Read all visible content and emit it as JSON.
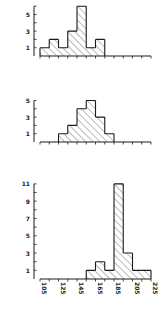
{
  "chart_data": [
    {
      "type": "bar",
      "subtype": "histogram",
      "title": "",
      "xlabel": "",
      "ylabel": "",
      "bin_width": 10,
      "bins": [
        "105-115",
        "115-125",
        "125-135",
        "135-145",
        "145-155",
        "155-165",
        "165-175",
        "175-185",
        "185-195",
        "195-205",
        "205-215",
        "215-225"
      ],
      "values": [
        1,
        2,
        1,
        3,
        6,
        1,
        2,
        0,
        0,
        0,
        0,
        0
      ],
      "ylim": [
        0,
        6
      ],
      "ytick_labels": [
        "1",
        "3",
        "5"
      ],
      "xlim": [
        105,
        225
      ],
      "hatched": true
    },
    {
      "type": "bar",
      "subtype": "histogram",
      "title": "",
      "xlabel": "",
      "ylabel": "",
      "bin_width": 10,
      "bins": [
        "105-115",
        "115-125",
        "125-135",
        "135-145",
        "145-155",
        "155-165",
        "165-175",
        "175-185",
        "185-195",
        "195-205",
        "205-215",
        "215-225"
      ],
      "values": [
        0,
        0,
        1,
        2,
        4,
        5,
        3,
        1,
        0,
        0,
        0,
        0
      ],
      "ylim": [
        0,
        5
      ],
      "ytick_labels": [
        "1",
        "3",
        "5"
      ],
      "xlim": [
        105,
        225
      ],
      "hatched": true
    },
    {
      "type": "bar",
      "subtype": "histogram",
      "title": "",
      "xlabel": "",
      "ylabel": "",
      "bin_width": 10,
      "bins": [
        "105-115",
        "115-125",
        "125-135",
        "135-145",
        "145-155",
        "155-165",
        "165-175",
        "175-185",
        "185-195",
        "195-205",
        "205-215",
        "215-225"
      ],
      "values": [
        0,
        0,
        0,
        0,
        0,
        1,
        2,
        1,
        11,
        3,
        1,
        1
      ],
      "ylim": [
        0,
        11
      ],
      "ytick_labels": [
        "1",
        "3",
        "5",
        "7",
        "9",
        "11"
      ],
      "xlim": [
        105,
        225
      ],
      "xtick_labels": [
        "105",
        "125",
        "145",
        "165",
        "185",
        "205",
        "225"
      ],
      "hatched": true
    }
  ],
  "layout": {
    "x0": 40,
    "px_per_unit": 0.925,
    "x_min": 105,
    "x_max": 225,
    "panels": [
      {
        "baseline": 56,
        "unit_px": 8.3,
        "ymax": 6
      },
      {
        "baseline": 142,
        "unit_px": 8.3,
        "ymax": 5
      },
      {
        "baseline": 279,
        "unit_px": 8.65,
        "ymax": 11
      }
    ],
    "stroke_color": "#1a1a1a",
    "hatch_color": "#555555"
  }
}
